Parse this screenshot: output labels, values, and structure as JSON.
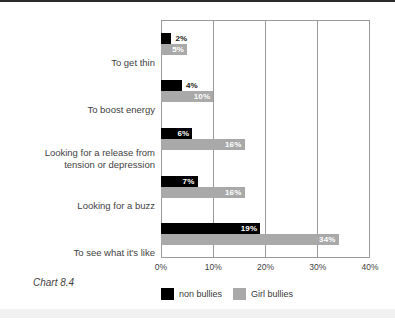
{
  "caption": "Chart 8.4",
  "chart_data": {
    "type": "bar",
    "orientation": "horizontal",
    "title": "",
    "xlabel": "",
    "ylabel": "",
    "xlim": [
      0,
      40
    ],
    "grid": true,
    "legend_position": "bottom",
    "categories": [
      "To get thin",
      "To boost energy",
      "Looking for a release from tension or depression",
      "Looking for a buzz",
      "To see what it's like"
    ],
    "category_lines": [
      [
        "To get thin"
      ],
      [
        "To boost energy"
      ],
      [
        "Looking for a release from",
        "tension or depression"
      ],
      [
        "Looking for a buzz"
      ],
      [
        "To see what it's like"
      ]
    ],
    "xticks": [
      "0%",
      "10%",
      "20%",
      "30%",
      "40%"
    ],
    "xtick_values": [
      0,
      10,
      20,
      30,
      40
    ],
    "series": [
      {
        "name": "non bullies",
        "color": "#000000",
        "values": [
          2,
          4,
          6,
          7,
          19
        ],
        "labels": [
          "2%",
          "4%",
          "6%",
          "7%",
          "19%"
        ]
      },
      {
        "name": "Girl bullies",
        "color": "#a9a9a9",
        "values": [
          5,
          10,
          16,
          16,
          34
        ],
        "labels": [
          "5%",
          "10%",
          "16%",
          "16%",
          "34%"
        ]
      }
    ]
  }
}
